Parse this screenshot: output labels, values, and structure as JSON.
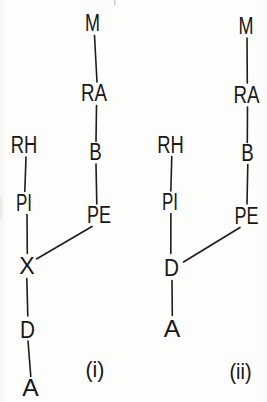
{
  "figure": {
    "type": "tree-diagram",
    "ink_color": "#1c1c1c",
    "background_color": "#fdfdfc",
    "diagrams": [
      {
        "caption": "(i)",
        "nodes": {
          "m": "M",
          "ra": "RA",
          "b": "B",
          "pe": "PE",
          "rh": "RH",
          "pi": "PI",
          "x": "X",
          "d": "D",
          "a": "A"
        },
        "edges": [
          [
            "M",
            "RA"
          ],
          [
            "RA",
            "B"
          ],
          [
            "B",
            "PE"
          ],
          [
            "RH",
            "PI"
          ],
          [
            "PI",
            "X"
          ],
          [
            "PE",
            "X"
          ],
          [
            "X",
            "D"
          ],
          [
            "D",
            "A"
          ]
        ]
      },
      {
        "caption": "(ii)",
        "nodes": {
          "m": "M",
          "ra": "RA",
          "b": "B",
          "pe": "PE",
          "rh": "RH",
          "pi": "PI",
          "d": "D",
          "a": "A"
        },
        "edges": [
          [
            "M",
            "RA"
          ],
          [
            "RA",
            "B"
          ],
          [
            "B",
            "PE"
          ],
          [
            "RH",
            "PI"
          ],
          [
            "PI",
            "D"
          ],
          [
            "PE",
            "D"
          ],
          [
            "D",
            "A"
          ]
        ]
      }
    ]
  }
}
